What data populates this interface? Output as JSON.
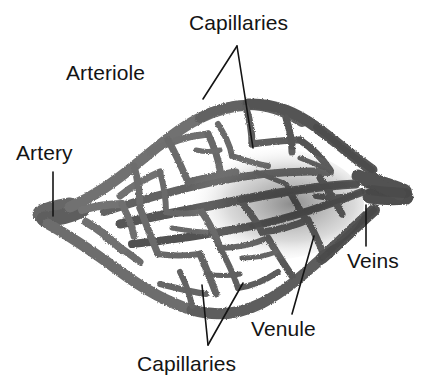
{
  "figure": {
    "background_color": "#ffffff",
    "ink_color": "#141414",
    "vessel_color": "#6b6b6b",
    "vessel_dark_color": "#3a3a3a"
  },
  "labels": {
    "capillaries_top": "Capillaries",
    "arteriole": "Arteriole",
    "artery": "Artery",
    "veins": "Veins",
    "venule": "Venule",
    "capillaries_bottom": "Capillaries"
  },
  "leaders": {
    "capillaries_top_left": "line from (237,46) to (203,99)",
    "capillaries_top_right": "line from (237,46) to (253,148)",
    "artery": "line from (53,172) to (53,216)",
    "veins": "line from (366,205) to (366,246)",
    "venule": "line from (314,236) to (292,314)",
    "capillaries_bottom_left": "line from (208,345) to (202,285)",
    "capillaries_bottom_right": "line from (208,345) to (243,283)"
  },
  "structure": {
    "artery_inlet": "left side, around x=45 y=215",
    "vein_outlet": "right side, around x=395 y=196",
    "network": "lens-shaped mesh of anastomosing capillaries between arteriole and venule"
  }
}
